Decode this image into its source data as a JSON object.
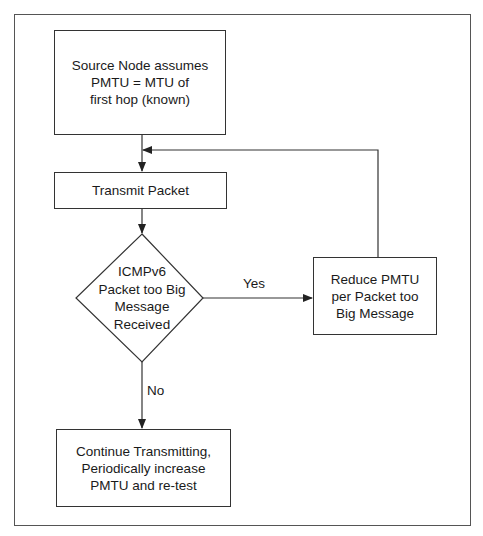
{
  "diagram": {
    "type": "flowchart",
    "nodes": {
      "start": {
        "label": "Source Node assumes\nPMTU = MTU of\nfirst hop (known)",
        "shape": "rectangle"
      },
      "transmit": {
        "label": "Transmit Packet",
        "shape": "rectangle"
      },
      "decision": {
        "label": "ICMPv6\nPacket too Big\nMessage\nReceived",
        "shape": "diamond"
      },
      "reduce": {
        "label": "Reduce PMTU\nper Packet too\nBig Message",
        "shape": "rectangle"
      },
      "continue": {
        "label": "Continue Transmitting,\nPeriodically increase\nPMTU and re-test",
        "shape": "rectangle"
      }
    },
    "edges": [
      {
        "from": "start",
        "to": "transmit",
        "label": ""
      },
      {
        "from": "transmit",
        "to": "decision",
        "label": ""
      },
      {
        "from": "decision",
        "to": "reduce",
        "label": "Yes"
      },
      {
        "from": "decision",
        "to": "continue",
        "label": "No"
      },
      {
        "from": "reduce",
        "to": "transmit",
        "label": ""
      }
    ],
    "edge_labels": {
      "yes": "Yes",
      "no": "No"
    },
    "colors": {
      "stroke": "#333333",
      "frame": "#555555",
      "background": "#ffffff"
    }
  }
}
